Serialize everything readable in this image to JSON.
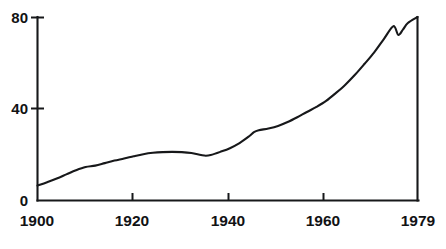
{
  "chart_data": {
    "type": "line",
    "title": "",
    "subtitle": "",
    "xlabel": "",
    "ylabel": "",
    "xlim": [
      1900,
      1979
    ],
    "ylim": [
      0,
      80
    ],
    "grid": false,
    "legend": null,
    "x_ticks": [
      1900,
      1920,
      1940,
      1960,
      1979
    ],
    "x_tick_labels": [
      "1900",
      "1920",
      "1940",
      "1960",
      "1979"
    ],
    "y_ticks": [
      0,
      40,
      80
    ],
    "y_tick_labels": [
      "0",
      "40",
      "80"
    ],
    "line_color": "#17181a",
    "axis_color": "#17181a",
    "background_color": "#ffffff",
    "series": [
      {
        "name": "value",
        "x": [
          1900,
          1902,
          1904,
          1906,
          1908,
          1910,
          1912,
          1914,
          1916,
          1918,
          1920,
          1922,
          1924,
          1926,
          1928,
          1930,
          1932,
          1934,
          1935,
          1936,
          1938,
          1940,
          1942,
          1944,
          1945,
          1946,
          1948,
          1950,
          1952,
          1954,
          1956,
          1958,
          1960,
          1962,
          1964,
          1966,
          1968,
          1970,
          1972,
          1974,
          1975,
          1976,
          1977,
          1979
        ],
        "values": [
          6.5,
          8.0,
          9.6,
          11.4,
          13.2,
          14.6,
          15.2,
          16.3,
          17.4,
          18.3,
          19.3,
          20.2,
          20.8,
          21.1,
          21.2,
          21.1,
          20.7,
          19.8,
          19.5,
          19.8,
          21.2,
          22.8,
          25.0,
          28.0,
          29.8,
          30.6,
          31.4,
          32.5,
          34.2,
          36.3,
          38.6,
          40.8,
          43.4,
          46.8,
          50.5,
          54.8,
          59.6,
          64.6,
          70.4,
          76.0,
          72.2,
          74.6,
          77.4,
          80.0
        ]
      }
    ]
  },
  "axes": {
    "y_axis_name": "value-axis",
    "x_axis_name": "year-axis"
  }
}
